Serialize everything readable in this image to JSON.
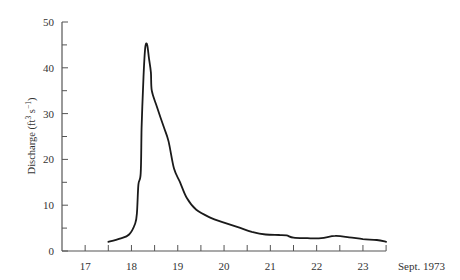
{
  "chart_data": {
    "type": "line",
    "title": "",
    "xlabel": "Sept. 1973",
    "ylabel": "Discharge (ft³ s⁻¹)",
    "ylabel_parts": {
      "main": "Discharge (ft",
      "sup1": "3",
      "mid": " s",
      "sup2": "−1",
      "end": ")"
    },
    "xlim": [
      16.5,
      23.5
    ],
    "ylim": [
      0,
      50
    ],
    "x_ticks": [
      17,
      18,
      19,
      20,
      21,
      22,
      23
    ],
    "x_minor_ticks": [
      16.5,
      17.5,
      18.5,
      19.5,
      20.5,
      21.5,
      22.5,
      23.5
    ],
    "y_ticks": [
      0,
      10,
      20,
      30,
      40,
      50
    ],
    "y_minor_ticks": [
      5,
      15,
      25,
      35,
      45
    ],
    "grid": false,
    "legend": null,
    "series": [
      {
        "name": "Discharge",
        "color": "#1a1a1a",
        "x": [
          17.5,
          17.75,
          17.95,
          18.08,
          18.12,
          18.15,
          18.2,
          18.22,
          18.26,
          18.3,
          18.34,
          18.38,
          18.42,
          18.44,
          18.55,
          18.7,
          18.8,
          18.92,
          19.05,
          19.2,
          19.4,
          19.7,
          20.0,
          20.3,
          20.6,
          20.9,
          21.2,
          21.35,
          21.5,
          21.8,
          22.1,
          22.4,
          22.7,
          23.0,
          23.3,
          23.5
        ],
        "y": [
          2.0,
          2.7,
          3.6,
          6.0,
          8.5,
          14.5,
          17.0,
          27.0,
          38.0,
          44.5,
          45.0,
          42.0,
          39.0,
          35.0,
          31.5,
          27.0,
          24.0,
          18.0,
          15.0,
          11.5,
          9.0,
          7.3,
          6.2,
          5.2,
          4.2,
          3.6,
          3.5,
          3.4,
          2.9,
          2.8,
          2.8,
          3.3,
          3.0,
          2.6,
          2.4,
          2.0
        ]
      }
    ]
  }
}
